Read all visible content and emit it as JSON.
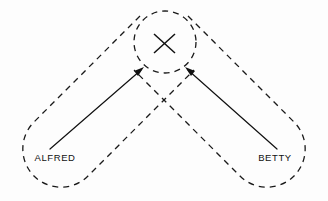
{
  "diagram": {
    "type": "venn-overlap-pointing-diagram",
    "background_color": "#fdfdfd",
    "stroke_color": "#1a1a1a",
    "labels": {
      "left_actor": "ALFRED",
      "right_actor": "BETTY"
    },
    "target": {
      "marker": "×",
      "marker_name": "x-mark",
      "shape": "dashed-circle",
      "center_x": 165,
      "center_y": 42,
      "radius": 31
    },
    "regions": [
      {
        "name": "alfred-region",
        "style": "dashed",
        "label": "ALFRED",
        "label_x": 55,
        "label_y": 158
      },
      {
        "name": "betty-region",
        "style": "dashed",
        "label": "BETTY",
        "label_x": 275,
        "label_y": 158
      }
    ],
    "pointers": [
      {
        "name": "alfred-pointer",
        "from_x": 50,
        "from_y": 149,
        "to_x": 143,
        "to_y": 68,
        "direction": "up-right"
      },
      {
        "name": "betty-pointer",
        "from_x": 277,
        "from_y": 149,
        "to_x": 186,
        "to_y": 68,
        "direction": "up-left"
      }
    ]
  }
}
